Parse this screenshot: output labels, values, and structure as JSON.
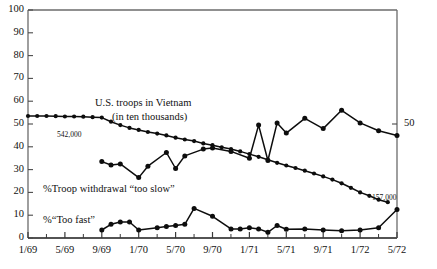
{
  "chart_data": {
    "type": "line",
    "title": "",
    "xlabel": "",
    "ylabel": "",
    "ylim": [
      0,
      100
    ],
    "grid": false,
    "legend_position": "inline-annotations",
    "y_ticks": [
      0,
      10,
      20,
      30,
      40,
      50,
      60,
      70,
      80,
      90,
      100
    ],
    "x_ticks": [
      "1/69",
      "5/69",
      "9/69",
      "1/70",
      "5/70",
      "9/70",
      "1/71",
      "5/71",
      "9/71",
      "1/72",
      "5/72"
    ],
    "right_axis_ticks": [
      50
    ],
    "series": [
      {
        "name": "U.S. troops in Vietnam (in ten thousands)",
        "x": [
          "1/69",
          "2/69",
          "3/69",
          "4/69",
          "5/69",
          "6/69",
          "7/69",
          "8/69",
          "9/69",
          "10/69",
          "11/69",
          "12/69",
          "1/70",
          "2/70",
          "3/70",
          "4/70",
          "5/70",
          "6/70",
          "7/70",
          "8/70",
          "9/70",
          "10/70",
          "11/70",
          "12/70",
          "1/71",
          "2/71",
          "3/71",
          "4/71",
          "5/71",
          "6/71",
          "7/71",
          "8/71",
          "9/71",
          "10/71",
          "11/71",
          "12/71",
          "1/72",
          "2/72",
          "3/72",
          "4/72"
        ],
        "values": [
          53.5,
          53.5,
          53.5,
          53.4,
          53.3,
          53.3,
          53.2,
          53.0,
          52.8,
          51.0,
          49.5,
          48.3,
          47.4,
          46.5,
          45.8,
          45.0,
          44.0,
          43.2,
          42.5,
          41.5,
          40.7,
          39.8,
          39.0,
          38.0,
          36.8,
          35.6,
          34.3,
          33.0,
          31.8,
          30.7,
          29.5,
          28.3,
          27.0,
          25.6,
          24.0,
          22.0,
          20.0,
          18.5,
          16.8,
          15.7
        ]
      },
      {
        "name": "%Troop withdrawal \"too slow\"",
        "x": [
          "9/69",
          "10/69",
          "11/69",
          "1/70",
          "2/70",
          "4/70",
          "5/70",
          "6/70",
          "8/70",
          "9/70",
          "11/70",
          "1/71",
          "2/71",
          "3/71",
          "4/71",
          "5/71",
          "7/71",
          "9/71",
          "11/71",
          "1/72",
          "3/72",
          "5/72"
        ],
        "values": [
          33.5,
          32.0,
          32.5,
          26.5,
          31.5,
          37.5,
          30.5,
          36.0,
          39.0,
          39.5,
          38.0,
          35.0,
          49.5,
          34.0,
          50.5,
          46.0,
          52.5,
          48.0,
          56.0,
          50.5,
          47.0,
          45.0
        ]
      },
      {
        "name": "%\"Too fast\"",
        "x": [
          "9/69",
          "10/69",
          "11/69",
          "12/69",
          "1/70",
          "3/70",
          "4/70",
          "5/70",
          "6/70",
          "7/70",
          "9/70",
          "11/70",
          "12/70",
          "1/71",
          "2/71",
          "3/71",
          "4/71",
          "5/71",
          "7/71",
          "9/71",
          "11/71",
          "1/72",
          "3/72",
          "5/72"
        ],
        "values": [
          3.5,
          6.0,
          7.0,
          7.0,
          3.5,
          4.5,
          5.0,
          5.5,
          6.0,
          13.0,
          9.5,
          4.0,
          4.0,
          4.5,
          4.0,
          2.5,
          5.5,
          3.8,
          4.0,
          3.5,
          3.2,
          3.5,
          4.5,
          12.5
        ]
      }
    ],
    "annotations": [
      {
        "name": "troops-label",
        "text": "U.S. troops in Vietnam",
        "x": 95,
        "y": 97
      },
      {
        "name": "troops-label-sub",
        "text": "(in ten thousands)",
        "x": 112,
        "y": 111
      },
      {
        "name": "troops-start-value",
        "text": "542,000",
        "x": 57,
        "y": 130
      },
      {
        "name": "troops-end-value",
        "text": "157,000",
        "x": 372,
        "y": 193
      },
      {
        "name": "too-slow-label",
        "text": "%Troop withdrawal “too slow”",
        "x": 43,
        "y": 183
      },
      {
        "name": "too-fast-label",
        "text": "%“Too fast”",
        "x": 43,
        "y": 214
      }
    ]
  }
}
